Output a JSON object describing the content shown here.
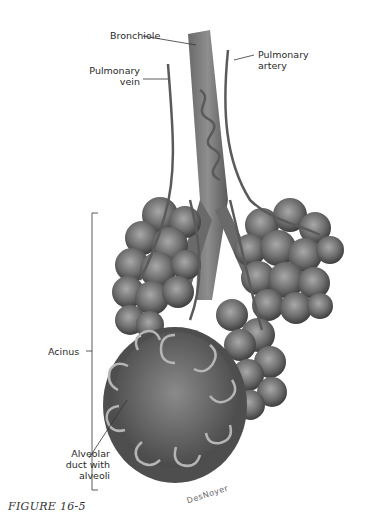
{
  "figure": {
    "caption": "FIGURE 16-5",
    "signature": "DesNoyer",
    "labels": {
      "bronchiole": "Bronchiole",
      "pulmonary_artery_line1": "Pulmonary",
      "pulmonary_artery_line2": "artery",
      "pulmonary_vein_line1": "Pulmonary",
      "pulmonary_vein_line2": "vein",
      "acinus": "Acinus",
      "alveolar_line1": "Alveolar",
      "alveolar_line2": "duct with",
      "alveolar_line3": "alveoli"
    },
    "colors": {
      "tissue_dark": "#4a4a4a",
      "tissue_mid": "#707070",
      "tissue_light": "#9a9a9a",
      "vessel": "#5a5a5a",
      "leader_line": "#333333",
      "background": "#ffffff"
    }
  }
}
